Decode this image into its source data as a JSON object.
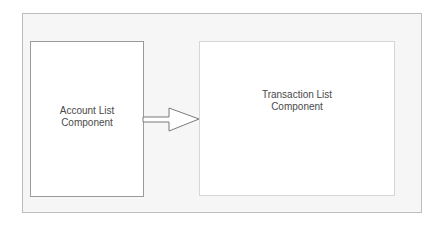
{
  "diagram": {
    "nodes": [
      {
        "id": "account-list",
        "label": "Account List\nComponent"
      },
      {
        "id": "transaction-list",
        "label": "Transaction List\nComponent"
      }
    ],
    "edges": [
      {
        "from": "account-list",
        "to": "transaction-list",
        "style": "hollow-block-arrow"
      }
    ],
    "colors": {
      "container_fill": "#f6f6f6",
      "container_border": "#bdbdbd",
      "node_fill": "#ffffff",
      "node_border": "#9a9a9a",
      "text": "#4a4a4a",
      "arrow_stroke": "#7a7a7a"
    }
  }
}
